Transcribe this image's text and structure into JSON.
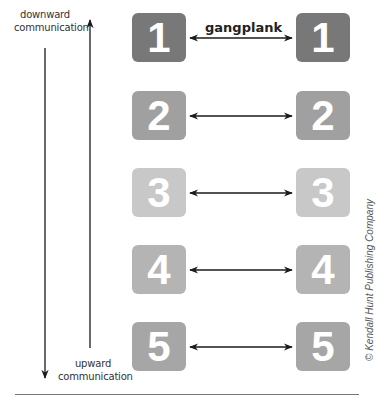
{
  "diagram": {
    "title_connector": "gangplank",
    "left_labels": {
      "downward": "downward\ncommunication",
      "upward": "upward\ncommunication"
    },
    "levels": [
      {
        "number": "1",
        "color": "#787878"
      },
      {
        "number": "2",
        "color": "#a0a0a0"
      },
      {
        "number": "3",
        "color": "#c8c8c8"
      },
      {
        "number": "4",
        "color": "#b4b4b4"
      },
      {
        "number": "5",
        "color": "#a6a6a6"
      }
    ],
    "credit": "© Kendall Hunt Publishing Company"
  }
}
